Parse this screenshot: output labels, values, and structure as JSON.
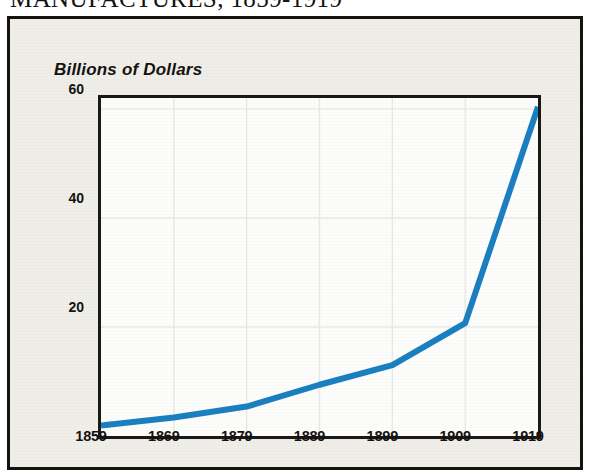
{
  "title": "MANUFACTURES, 1859-1919",
  "y_axis_caption": "Billions of Dollars",
  "colors": {
    "line": "#1a7fc1",
    "axis": "#1b1815",
    "frame": "#15120f",
    "panel_background": "#efeee9",
    "plot_background": "#fdfdfc",
    "gridline": "#e6e6e2",
    "text": "#15120f"
  },
  "chart_data": {
    "type": "line",
    "title": "MANUFACTURES, 1859-1919",
    "xlabel": "",
    "ylabel": "Billions of Dollars",
    "x": [
      1859,
      1869,
      1879,
      1889,
      1899,
      1909,
      1919
    ],
    "values": [
      1.9,
      3.4,
      5.4,
      9.4,
      13.0,
      20.7,
      60.4
    ],
    "series": [
      {
        "name": "Value of Manufactures",
        "values": [
          1.9,
          3.4,
          5.4,
          9.4,
          13.0,
          20.7,
          60.4
        ]
      }
    ],
    "xlim": [
      1859,
      1919
    ],
    "ylim": [
      0,
      62
    ],
    "xticks": [
      "1859",
      "1869",
      "1879",
      "1889",
      "1899",
      "1909",
      "1919"
    ],
    "yticks": [
      "20",
      "40",
      "60"
    ],
    "ytick_values": [
      20,
      40,
      60
    ],
    "grid": true,
    "legend": "none",
    "line_color": "#1a7fc1",
    "line_width": 6
  }
}
